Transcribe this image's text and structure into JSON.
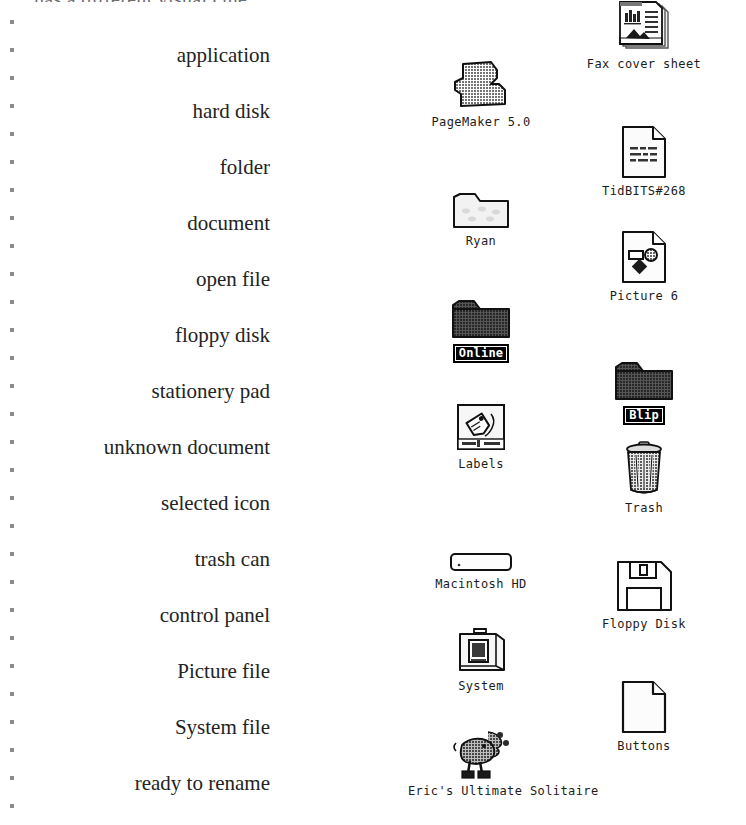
{
  "page": {
    "cut_off_heading": "has a different visual clue.",
    "background_color": "#ffffff",
    "ink_color": "#1a1a1a",
    "selection_color": "#000000"
  },
  "label_column": {
    "align": "right",
    "items": [
      {
        "text": "application",
        "top": 45
      },
      {
        "text": "hard disk",
        "top": 101
      },
      {
        "text": "folder",
        "top": 157
      },
      {
        "text": "document",
        "top": 213
      },
      {
        "text": "open file",
        "top": 269
      },
      {
        "text": "floppy disk",
        "top": 325
      },
      {
        "text": "stationery pad",
        "top": 381
      },
      {
        "text": "unknown document",
        "top": 437
      },
      {
        "text": "selected icon",
        "top": 493
      },
      {
        "text": "trash can",
        "top": 549
      },
      {
        "text": "control panel",
        "top": 605
      },
      {
        "text": "Picture file",
        "top": 661
      },
      {
        "text": "System file",
        "top": 717
      },
      {
        "text": "ready to rename",
        "top": 773
      }
    ]
  },
  "dot_rail": {
    "count": 29,
    "start_top": 12,
    "spacing": 28,
    "color": "#8a8a8e"
  },
  "desktop": {
    "columns": [
      {
        "name": "middle-column",
        "center_x": 481
      },
      {
        "name": "right-column",
        "center_x": 644
      }
    ],
    "icons": [
      {
        "name": "Fax cover sheet",
        "icon": "stationery-pad-icon",
        "column": 1,
        "top": 8,
        "selected": false
      },
      {
        "name": "PageMaker 5.0",
        "icon": "application-icon",
        "column": 0,
        "top": 66,
        "selected": false
      },
      {
        "name": "TidBITS#268",
        "icon": "document-icon",
        "column": 1,
        "top": 135,
        "selected": false
      },
      {
        "name": "Ryan",
        "icon": "folder-icon",
        "column": 0,
        "top": 185,
        "selected": false
      },
      {
        "name": "Picture 6",
        "icon": "picture-file-icon",
        "column": 1,
        "top": 240,
        "selected": false
      },
      {
        "name": "Online",
        "icon": "open-folder-selected-icon",
        "column": 0,
        "top": 295,
        "selected": true
      },
      {
        "name": "Blip",
        "icon": "open-folder-selected-icon",
        "column": 1,
        "top": 357,
        "selected": true
      },
      {
        "name": "Labels",
        "icon": "control-panel-icon",
        "column": 0,
        "top": 408,
        "selected": false
      },
      {
        "name": "Trash",
        "icon": "trash-can-icon",
        "column": 1,
        "top": 452,
        "selected": false
      },
      {
        "name": "Macintosh HD",
        "icon": "hard-disk-icon",
        "column": 0,
        "top": 528,
        "selected": false
      },
      {
        "name": "Floppy Disk",
        "icon": "floppy-disk-icon",
        "column": 1,
        "top": 568,
        "selected": false
      },
      {
        "name": "System",
        "icon": "system-suitcase-icon",
        "column": 0,
        "top": 630,
        "selected": false
      },
      {
        "name": "Buttons",
        "icon": "unknown-document-icon",
        "column": 1,
        "top": 690,
        "selected": false
      },
      {
        "name": "Eric's Ultimate Solitaire",
        "icon": "solitaire-jester-icon",
        "column": 0,
        "top": 735,
        "selected": false
      }
    ]
  }
}
